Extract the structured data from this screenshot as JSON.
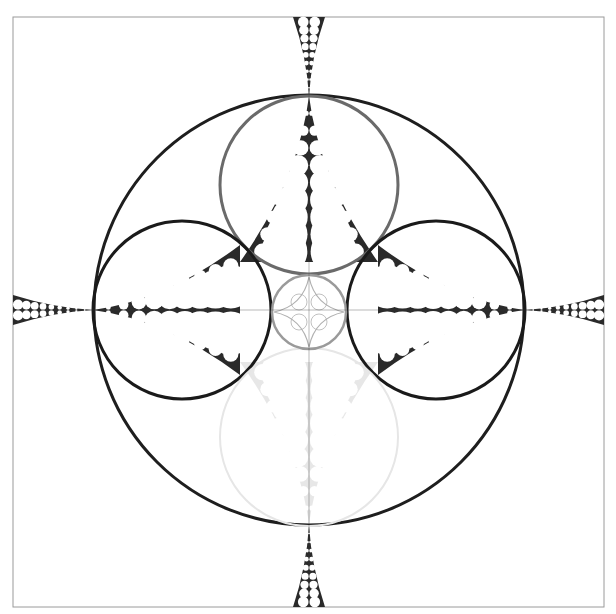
{
  "frame": {
    "x": 13,
    "y": 17,
    "width": 591,
    "height": 590,
    "stroke": "#9a9a9a"
  },
  "background": "#ffffff",
  "circles": [
    {
      "id": "outer-circle",
      "cx": 309,
      "cy": 310,
      "r": 215,
      "stroke": "#1e1e1e",
      "width": 3
    },
    {
      "id": "top-circle",
      "cx": 309,
      "cy": 185,
      "r": 89,
      "stroke": "#6a6a6a",
      "width": 3
    },
    {
      "id": "left-circle",
      "cx": 182,
      "cy": 310,
      "r": 89,
      "stroke": "#1a1a1a",
      "width": 3
    },
    {
      "id": "right-circle",
      "cx": 436,
      "cy": 310,
      "r": 89,
      "stroke": "#1a1a1a",
      "width": 3
    },
    {
      "id": "bottom-circle",
      "cx": 309,
      "cy": 437,
      "r": 89,
      "stroke": "#e6e6e6",
      "width": 2
    },
    {
      "id": "center-circle",
      "cx": 309,
      "cy": 312,
      "r": 37,
      "stroke": "#9a9a9a",
      "width": 2.5
    }
  ],
  "gaskets": [
    {
      "id": "top-inner",
      "tip": [
        309,
        96
      ],
      "base_left": [
        240,
        262
      ],
      "base_right": [
        378,
        262
      ],
      "color": "#2a2a2a",
      "opacity": 1
    },
    {
      "id": "left-inner",
      "tip": [
        93,
        310
      ],
      "base_left": [
        240,
        245
      ],
      "base_right": [
        240,
        375
      ],
      "color": "#2a2a2a",
      "opacity": 1
    },
    {
      "id": "right-inner",
      "tip": [
        525,
        310
      ],
      "base_left": [
        378,
        245
      ],
      "base_right": [
        378,
        375
      ],
      "color": "#2a2a2a",
      "opacity": 1
    },
    {
      "id": "bottom-inner",
      "tip": [
        309,
        525
      ],
      "base_left": [
        240,
        362
      ],
      "base_right": [
        378,
        362
      ],
      "color": "#d8d8d8",
      "opacity": 0.6
    },
    {
      "id": "top-outer",
      "tip": [
        309,
        96
      ],
      "base_left": [
        293,
        17
      ],
      "base_right": [
        325,
        17
      ],
      "color": "#2a2a2a",
      "opacity": 1
    },
    {
      "id": "bottom-outer",
      "tip": [
        309,
        525
      ],
      "base_left": [
        293,
        607
      ],
      "base_right": [
        325,
        607
      ],
      "color": "#2a2a2a",
      "opacity": 1
    },
    {
      "id": "left-outer",
      "tip": [
        93,
        310
      ],
      "base_left": [
        13,
        295
      ],
      "base_right": [
        13,
        325
      ],
      "color": "#2a2a2a",
      "opacity": 1
    },
    {
      "id": "right-outer",
      "tip": [
        525,
        310
      ],
      "base_left": [
        604,
        295
      ],
      "base_right": [
        604,
        325
      ],
      "color": "#2a2a2a",
      "opacity": 1
    }
  ],
  "center_star": {
    "cx": 309,
    "cy": 312,
    "r": 35,
    "color": "#b0b0b0"
  }
}
